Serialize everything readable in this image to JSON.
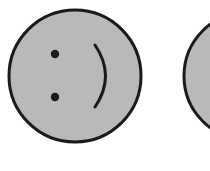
{
  "scene": {
    "description": "Two gray smiley faces drawn sideways; second face cut off at the right edge",
    "background": "#ffffff",
    "faces": [
      {
        "name": "smiley-face-1",
        "fill": "#b9b9b9",
        "stroke": "#1a1a1a"
      },
      {
        "name": "smiley-face-2",
        "fill": "#b9b9b9",
        "stroke": "#1a1a1a"
      }
    ]
  }
}
